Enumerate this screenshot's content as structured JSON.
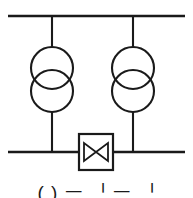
{
  "figure": {
    "kind": "electrical-single-line-diagram",
    "width": 193,
    "height": 198,
    "background_color": "#ffffff",
    "line_color": "#1a1a1a"
  },
  "buses": {
    "top": {
      "label": "upper busbar",
      "x1": 8,
      "x2": 185,
      "y": 16,
      "stroke_width": 2.4
    },
    "bottom": {
      "label": "lower busbar",
      "x1": 8,
      "x2": 185,
      "y": 152,
      "stroke_width": 2.4
    }
  },
  "feeders": [
    {
      "name": "left-feeder",
      "x": 52,
      "y_top": 16,
      "y_bottom": 152
    },
    {
      "name": "right-feeder",
      "x": 133,
      "y_top": 16,
      "y_bottom": 152
    }
  ],
  "transformers": [
    {
      "name": "left-transformer",
      "symbol": "two-winding-transformer",
      "cx": 52,
      "upper_circle_cy": 68,
      "lower_circle_cy": 91,
      "radius": 21,
      "stroke_width": 2.1
    },
    {
      "name": "right-transformer",
      "symbol": "two-winding-transformer",
      "cx": 133,
      "upper_circle_cy": 68,
      "lower_circle_cy": 91,
      "radius": 21,
      "stroke_width": 2.1
    }
  ],
  "tie_device": {
    "name": "bus-tie-valve",
    "symbol": "bowtie-valve",
    "box": {
      "x": 79,
      "y": 134,
      "width": 34,
      "height": 36,
      "stroke_width": 2.2
    },
    "bowtie": {
      "cx": 96,
      "cy": 152,
      "half_width": 12,
      "half_height": 9,
      "stroke_width": 1.8,
      "fill": "none"
    }
  },
  "caption": {
    "text": "( ) ᅳ ᅵ ᅳ ᅵ",
    "note": "caption clipped by bottom image edge"
  }
}
